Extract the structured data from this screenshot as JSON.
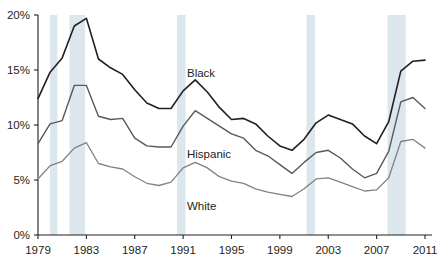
{
  "chart_data": {
    "type": "line",
    "title": "",
    "subtitle": "",
    "xlabel": "",
    "ylabel": "",
    "xlim": [
      1979,
      2011
    ],
    "ylim": [
      0,
      20
    ],
    "grid": false,
    "legend_position": "inline-labels",
    "y_ticks": [
      0,
      5,
      10,
      15,
      20
    ],
    "y_tick_labels": [
      "0%",
      "5%",
      "10%",
      "15%",
      "20%"
    ],
    "x_ticks": [
      1979,
      1983,
      1987,
      1991,
      1995,
      1999,
      2003,
      2007,
      2011
    ],
    "x_tick_labels": [
      "1979",
      "1983",
      "1987",
      "1991",
      "1995",
      "1999",
      "2003",
      "2007",
      "2011"
    ],
    "x": [
      1979,
      1980,
      1981,
      1982,
      1983,
      1984,
      1985,
      1986,
      1987,
      1988,
      1989,
      1990,
      1991,
      1992,
      1993,
      1994,
      1995,
      1996,
      1997,
      1998,
      1999,
      2000,
      2001,
      2002,
      2003,
      2004,
      2005,
      2006,
      2007,
      2008,
      2009,
      2010,
      2011
    ],
    "series": [
      {
        "name": "Black",
        "color": "#231f20",
        "width": 1.6,
        "label_text": "Black",
        "values": [
          12.4,
          14.8,
          16.1,
          19.0,
          19.7,
          16.0,
          15.2,
          14.6,
          13.2,
          12.0,
          11.5,
          11.5,
          13.1,
          14.1,
          13.0,
          11.6,
          10.5,
          10.6,
          10.1,
          9.0,
          8.1,
          7.7,
          8.7,
          10.2,
          10.9,
          10.5,
          10.1,
          9.0,
          8.3,
          10.3,
          14.9,
          15.8,
          15.9
        ]
      },
      {
        "name": "Hispanic",
        "color": "#58595b",
        "width": 1.4,
        "label_text": "Hispanic",
        "values": [
          8.3,
          10.1,
          10.4,
          13.6,
          13.6,
          10.8,
          10.5,
          10.6,
          8.8,
          8.1,
          8.0,
          8.0,
          9.9,
          11.3,
          10.6,
          9.9,
          9.2,
          8.8,
          7.7,
          7.2,
          6.4,
          5.6,
          6.6,
          7.5,
          7.7,
          7.0,
          6.0,
          5.2,
          5.6,
          7.6,
          12.1,
          12.5,
          11.5
        ]
      },
      {
        "name": "White",
        "color": "#808285",
        "width": 1.3,
        "label_text": "White",
        "values": [
          5.1,
          6.3,
          6.7,
          7.9,
          8.4,
          6.5,
          6.2,
          6.0,
          5.3,
          4.7,
          4.5,
          4.8,
          6.1,
          6.6,
          6.1,
          5.3,
          4.9,
          4.7,
          4.2,
          3.9,
          3.7,
          3.5,
          4.2,
          5.1,
          5.2,
          4.8,
          4.4,
          4.0,
          4.1,
          5.2,
          8.5,
          8.7,
          7.9
        ]
      }
    ],
    "recession_bands": [
      {
        "start": 1980.0,
        "end": 1980.6
      },
      {
        "start": 1981.6,
        "end": 1982.9
      },
      {
        "start": 1990.5,
        "end": 1991.2
      },
      {
        "start": 2001.2,
        "end": 2001.9
      },
      {
        "start": 2007.9,
        "end": 2009.4
      }
    ],
    "recession_band_color": "#dce6ed",
    "axis_color": "#231f20",
    "background_color": "#ffffff"
  }
}
